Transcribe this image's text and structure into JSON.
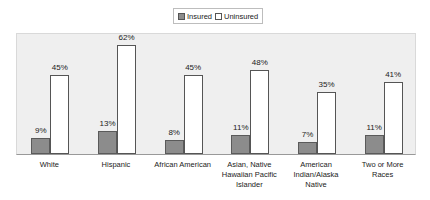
{
  "chart_data": {
    "type": "bar",
    "title": "",
    "xlabel": "",
    "ylabel": "",
    "ylim": [
      0,
      70
    ],
    "grid": false,
    "legend_position": "top",
    "categories": [
      "White",
      "Hispanic",
      "African American",
      "Asian, Native Hawaiian Pacific Islander",
      "American Indian/Alaska Native",
      "Two or More Races"
    ],
    "category_lines": [
      [
        "White"
      ],
      [
        "Hispanic"
      ],
      [
        "African American"
      ],
      [
        "Asian, Native",
        "Hawaiian Pacific",
        "Islander"
      ],
      [
        "American",
        "Indian/Alaska",
        "Native"
      ],
      [
        "Two or More",
        "Races"
      ]
    ],
    "series": [
      {
        "name": "Insured",
        "color": "#8c8c8c",
        "values": [
          9,
          13,
          8,
          11,
          7,
          11
        ],
        "labels": [
          "9%",
          "13%",
          "8%",
          "11%",
          "7%",
          "11%"
        ]
      },
      {
        "name": "Uninsured",
        "color": "#ffffff",
        "values": [
          45,
          62,
          45,
          48,
          35,
          41
        ],
        "labels": [
          "45%",
          "62%",
          "45%",
          "48%",
          "35%",
          "41%"
        ]
      }
    ]
  },
  "legend": {
    "insured_label": "Insured",
    "uninsured_label": "Uninsured"
  }
}
